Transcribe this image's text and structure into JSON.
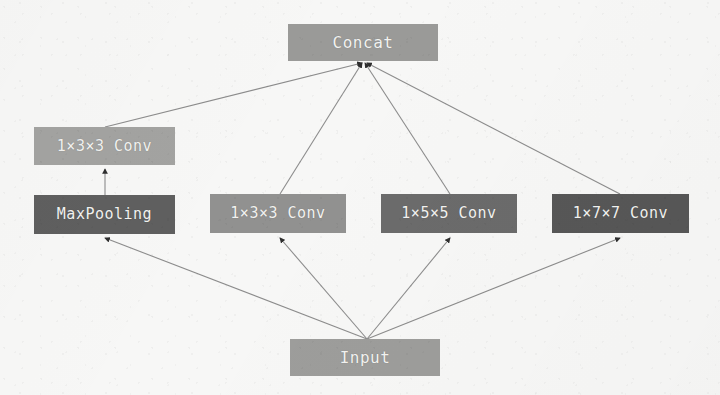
{
  "figure": {
    "background_color": "#f7f7f6",
    "edge_color": "#8c8c8c",
    "arrow_color": "#2e2e2e"
  },
  "nodes": [
    {
      "id": "concat",
      "label": "Concat",
      "color": "#9a9a98",
      "x": 288,
      "y": 24,
      "w": 150,
      "h": 37,
      "font_size": 16
    },
    {
      "id": "pool_conv",
      "label": "1×3×3 Conv",
      "color": "#a3a3a1",
      "x": 34,
      "y": 127,
      "w": 141,
      "h": 38,
      "font_size": 15
    },
    {
      "id": "maxpool",
      "label": "MaxPooling",
      "color": "#5f5f5f",
      "x": 34,
      "y": 195,
      "w": 141,
      "h": 39,
      "font_size": 15
    },
    {
      "id": "conv3",
      "label": "1×3×3 Conv",
      "color": "#919190",
      "x": 210,
      "y": 194,
      "w": 136,
      "h": 39,
      "font_size": 15
    },
    {
      "id": "conv5",
      "label": "1×5×5 Conv",
      "color": "#6b6b6b",
      "x": 381,
      "y": 194,
      "w": 136,
      "h": 39,
      "font_size": 15
    },
    {
      "id": "conv7",
      "label": "1×7×7 Conv",
      "color": "#575757",
      "x": 552,
      "y": 194,
      "w": 137,
      "h": 39,
      "font_size": 15
    },
    {
      "id": "input",
      "label": "Input",
      "color": "#9d9d9b",
      "x": 290,
      "y": 339,
      "w": 150,
      "h": 37,
      "font_size": 16
    }
  ],
  "edges": [
    {
      "id": "input-to-maxpool",
      "from": "input",
      "to": "maxpool",
      "x1": 367,
      "y1": 339,
      "x2": 105,
      "y2": 238
    },
    {
      "id": "input-to-conv3",
      "from": "input",
      "to": "conv3",
      "x1": 367,
      "y1": 339,
      "x2": 280,
      "y2": 238
    },
    {
      "id": "input-to-conv5",
      "from": "input",
      "to": "conv5",
      "x1": 367,
      "y1": 339,
      "x2": 450,
      "y2": 238
    },
    {
      "id": "input-to-conv7",
      "from": "input",
      "to": "conv7",
      "x1": 367,
      "y1": 339,
      "x2": 620,
      "y2": 238
    },
    {
      "id": "maxpool-to-poolconv",
      "from": "maxpool",
      "to": "pool_conv",
      "x1": 105,
      "y1": 195,
      "x2": 105,
      "y2": 169
    },
    {
      "id": "poolconv-to-concat",
      "from": "pool_conv",
      "to": "concat",
      "x1": 105,
      "y1": 127,
      "x2": 362,
      "y2": 63
    },
    {
      "id": "conv3-to-concat",
      "from": "conv3",
      "to": "concat",
      "x1": 280,
      "y1": 194,
      "x2": 362,
      "y2": 63
    },
    {
      "id": "conv5-to-concat",
      "from": "conv5",
      "to": "concat",
      "x1": 450,
      "y1": 194,
      "x2": 365,
      "y2": 63
    },
    {
      "id": "conv7-to-concat",
      "from": "conv7",
      "to": "concat",
      "x1": 620,
      "y1": 194,
      "x2": 367,
      "y2": 63
    }
  ]
}
